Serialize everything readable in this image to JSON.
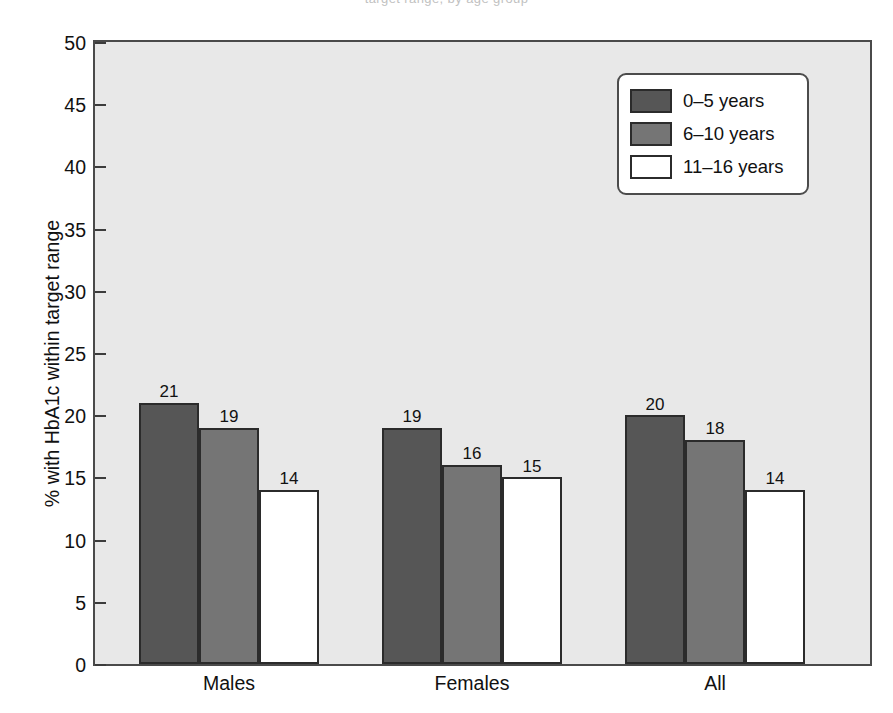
{
  "figure": {
    "caption_remnant": "target range, by age group",
    "background_color": "#ffffff",
    "plot_background_color": "#e8e8e8"
  },
  "chart_data": {
    "type": "bar",
    "title": "",
    "subtitle": "",
    "xlabel": "",
    "ylabel": "% with HbA1c within target range",
    "categories": [
      "Males",
      "Females",
      "All"
    ],
    "series": [
      {
        "name": "0–5 years",
        "color": "#565656",
        "values": [
          21,
          19,
          20
        ]
      },
      {
        "name": "6–10 years",
        "color": "#757575",
        "values": [
          19,
          16,
          18
        ]
      },
      {
        "name": "11–16 years",
        "color": "#ffffff",
        "values": [
          14,
          15,
          14
        ]
      }
    ],
    "data_labels": [
      [
        "21",
        "19",
        "14"
      ],
      [
        "19",
        "16",
        "15"
      ],
      [
        "20",
        "18",
        "14"
      ]
    ],
    "ylim": [
      0,
      50
    ],
    "ytick_values": [
      0,
      5,
      10,
      15,
      20,
      25,
      30,
      35,
      40,
      45,
      50
    ],
    "ytick_labels": [
      "0",
      "5",
      "10",
      "15",
      "20",
      "25",
      "30",
      "35",
      "40",
      "45",
      "50"
    ],
    "grid": false,
    "legend_position": "top-right",
    "bar_outline_color": "#2b2b2b"
  },
  "legend": {
    "items": [
      {
        "label": "0–5 years",
        "swatch": "dark"
      },
      {
        "label": "6–10 years",
        "swatch": "mid"
      },
      {
        "label": "11–16 years",
        "swatch": "light"
      }
    ]
  }
}
